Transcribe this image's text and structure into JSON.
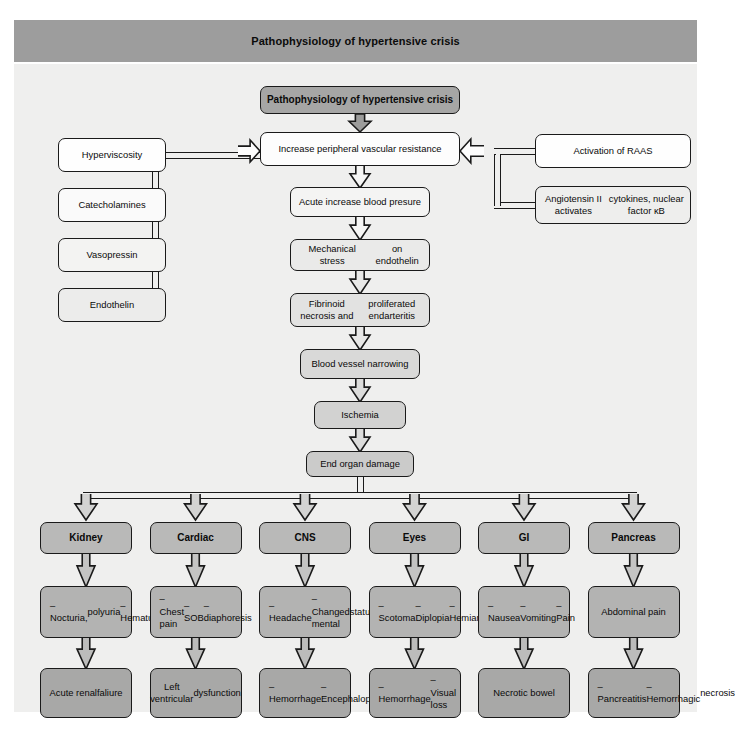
{
  "header": {
    "title": "Pathophysiology of hypertensive crisis"
  },
  "title_box": {
    "label": "Pathophysiology of hypertensive crisis"
  },
  "left_factors": [
    {
      "label": "Hyperviscosity",
      "shade": "#fefefe"
    },
    {
      "label": "Catecholamines",
      "shade": "#fafafa"
    },
    {
      "label": "Vasopressin",
      "shade": "#f3f3f2"
    },
    {
      "label": "Endothelin",
      "shade": "#ececeb"
    }
  ],
  "right_factors": [
    {
      "label": "Activation of RAAS",
      "shade": "#fefefe"
    },
    {
      "label": "Angiotensin II activates\ncytokines, nuclear factor κB",
      "shade": "#eeeeed"
    }
  ],
  "main_chain": [
    {
      "label": "Increase peripheral vascular resistance",
      "shade": "#fdfdfd"
    },
    {
      "label": "Acute increase blood presure",
      "shade": "#f4f4f3"
    },
    {
      "label": "Mechanical stress\non endothelin",
      "shade": "#eaeae9"
    },
    {
      "label": "Fibrinoid necrosis and\nproliferated endarteritis",
      "shade": "#e2e2e1"
    },
    {
      "label": "Blood vessel narrowing",
      "shade": "#d9d9d8"
    },
    {
      "label": "Ischemia",
      "shade": "#d2d2d1"
    },
    {
      "label": "End organ damage",
      "shade": "#cbcbca"
    }
  ],
  "organ_columns": [
    {
      "organ": "Kidney",
      "symptoms": "– Nocturia,\n   polyuria\n– Hematuria",
      "outcome": "Acute renal\nfaliure"
    },
    {
      "organ": "Cardiac",
      "symptoms": "– Chest pain\n– SOB\n– diaphoresis",
      "outcome": "Left ventricular\ndysfunction"
    },
    {
      "organ": "CNS",
      "symptoms": "– Headache\n– Changed mental\n   status",
      "outcome": "– Hemorrhage\n– Encephalopathy"
    },
    {
      "organ": "Eyes",
      "symptoms": "– Scotoma\n– Diplopia\n– Hemianopsia",
      "outcome": "– Hemorrhage\n– Visual loss"
    },
    {
      "organ": "GI",
      "symptoms": "– Nausea\n– Vomiting\n– Pain",
      "outcome": "Necrotic bowel"
    },
    {
      "organ": "Pancreas",
      "symptoms": "Abdominal pain",
      "outcome": "– Pancreatitis\n– Hemorrhagic\n   necrosis"
    }
  ],
  "palette": {
    "header_bg": "#9d9d9d",
    "panel_bg": "#efefee",
    "title_box_bg": "#a6a6a5",
    "organ_header_bg": "#b9b9b8",
    "organ_symptom_bg": "#b3b3b2",
    "organ_outcome_bg": "#a8a8a7",
    "stroke": "#1a1a1a"
  }
}
